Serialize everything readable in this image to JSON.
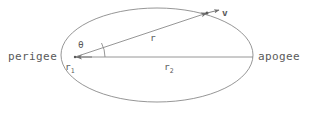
{
  "diagram": {
    "stroke_color": "#6e6e6e",
    "text_color": "#5a5a5a",
    "background": "#ffffff",
    "labels": {
      "perigee": "perigee",
      "apogee": "apogee",
      "r1_base": "r",
      "r1_sub": "1",
      "r2_base": "r",
      "r2_sub": "2",
      "r": "r",
      "v": "v",
      "theta": "θ"
    },
    "geometry": {
      "ellipse_center_x": 157,
      "ellipse_center_y": 55,
      "ellipse_rx": 96,
      "ellipse_ry": 47,
      "focus_x": 75,
      "focus_y": 57,
      "major_axis_end_x": 253,
      "major_axis_end_y": 57,
      "orbit_point_x": 207,
      "orbit_point_y": 13,
      "velocity_tip_x": 218,
      "velocity_tip_y": 10,
      "theta_arc_radius": 30,
      "theta_degrees": 28
    }
  }
}
